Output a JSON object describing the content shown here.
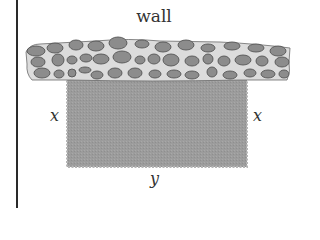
{
  "diagram": {
    "title_label": "wall",
    "side_labels": {
      "left": "x",
      "right": "x",
      "bottom": "y"
    },
    "colors": {
      "wall_mortar": "#dcdcdc",
      "wall_stone": "#8c8c8c",
      "stone_outline": "#555555",
      "field_fill": "#9a9a9a",
      "rule": "#2a2a2a",
      "text": "#333333"
    },
    "elements": [
      {
        "id": "wall",
        "type": "stone-wall",
        "desc": "horizontal stone wall band"
      },
      {
        "id": "field",
        "type": "rectangle",
        "desc": "fenced rectangular enclosure against wall"
      }
    ]
  }
}
